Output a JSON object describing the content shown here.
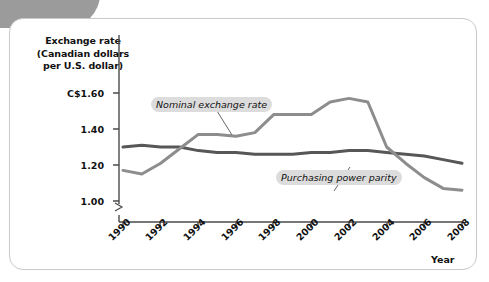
{
  "figure": {
    "y_axis_title_lines": [
      "Exchange rate",
      "(Canadian dollars",
      "per U.S. dollar)"
    ],
    "x_axis_title": "Year",
    "annotations": {
      "nominal": "Nominal exchange rate",
      "ppp": "Purchasing power parity"
    },
    "colors": {
      "nominal_line": "#8d8d8d",
      "ppp_line": "#575757",
      "axis": "#4a4a4a",
      "annotation_background": "#dcdcdc",
      "corner_tab": "#9b9b9b",
      "card_border": "#c9c9c9",
      "text": "#111111"
    }
  },
  "chart_data": {
    "type": "line",
    "title": "",
    "xlabel": "Year",
    "ylabel": "Exchange rate (Canadian dollars per U.S. dollar)",
    "xlim": [
      1990,
      2008
    ],
    "ylim": [
      1.0,
      1.6
    ],
    "yticks": [
      1.0,
      1.2,
      1.4,
      1.6
    ],
    "ytick_labels": [
      "1.00",
      "1.20",
      "1.40",
      "C$1.60"
    ],
    "xticks": [
      1990,
      1992,
      1994,
      1996,
      1998,
      2000,
      2002,
      2004,
      2006,
      2008
    ],
    "xtick_labels": [
      "1990",
      "1992",
      "1994",
      "1996",
      "1998",
      "2000",
      "2002",
      "2004",
      "2006",
      "2008"
    ],
    "grid": false,
    "legend": "annotations-inline",
    "axis_break_below_first_ytick": true,
    "x": [
      1990,
      1991,
      1992,
      1993,
      1994,
      1995,
      1996,
      1997,
      1998,
      1999,
      2000,
      2001,
      2002,
      2003,
      2004,
      2005,
      2006,
      2007,
      2008
    ],
    "series": [
      {
        "name": "Nominal exchange rate",
        "color": "#8d8d8d",
        "values": [
          1.17,
          1.15,
          1.21,
          1.29,
          1.37,
          1.37,
          1.36,
          1.38,
          1.48,
          1.48,
          1.48,
          1.55,
          1.57,
          1.55,
          1.3,
          1.21,
          1.13,
          1.07,
          1.06
        ]
      },
      {
        "name": "Purchasing power parity",
        "color": "#575757",
        "values": [
          1.3,
          1.31,
          1.3,
          1.3,
          1.28,
          1.27,
          1.27,
          1.26,
          1.26,
          1.26,
          1.27,
          1.27,
          1.28,
          1.28,
          1.27,
          1.26,
          1.25,
          1.23,
          1.21
        ]
      }
    ]
  }
}
